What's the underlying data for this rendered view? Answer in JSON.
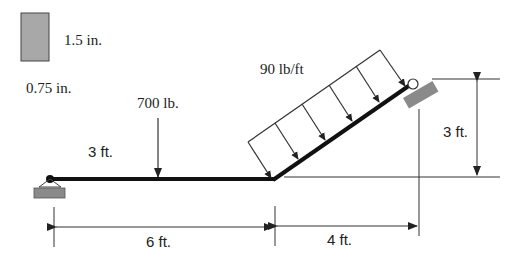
{
  "cross_section": {
    "height_label": "1.5 in.",
    "width_label": "0.75 in."
  },
  "loads": {
    "point_load_label": "700 lb.",
    "distributed_load_label": "90 lb/ft"
  },
  "dimensions": {
    "load_position_label": "3 ft.",
    "horizontal_span_label": "6 ft.",
    "inclined_run_label": "4 ft.",
    "inclined_rise_label": "3 ft."
  },
  "colors": {
    "beam": "#111111",
    "support_fill": "#8a8a8a",
    "section_fill": "#a8a8a8",
    "line": "#333333"
  }
}
